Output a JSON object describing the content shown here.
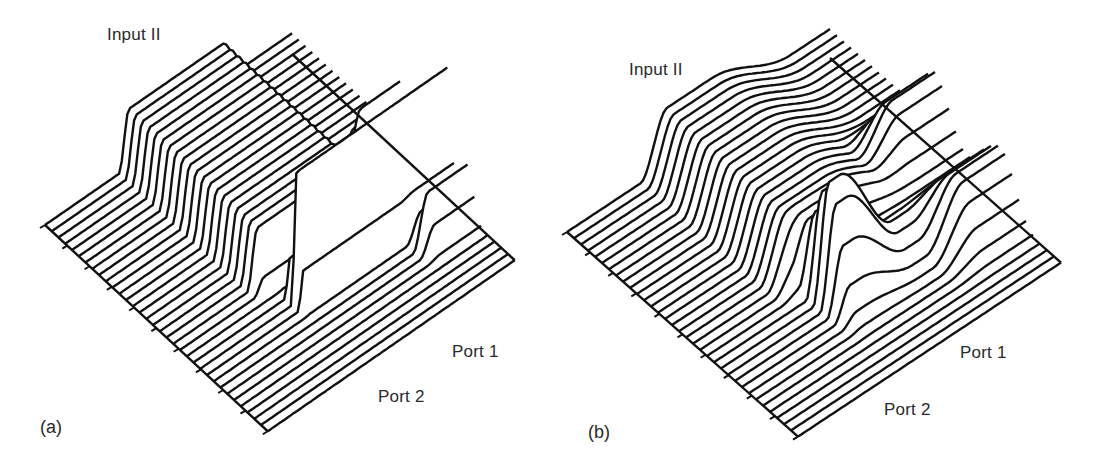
{
  "figure": {
    "panels": [
      {
        "id": "a",
        "panel_label": "(a)",
        "labels": {
          "input": "Input II",
          "port1": "Port 1",
          "port2": "Port 2"
        }
      },
      {
        "id": "b",
        "panel_label": "(b)",
        "labels": {
          "input": "Input II",
          "port1": "Port 1",
          "port2": "Port 2"
        }
      }
    ]
  },
  "chart_data": [
    {
      "type": "line",
      "subtype": "waterfall-3d",
      "title": "(a)",
      "xlabel": "",
      "ylabel": "",
      "annotations": [
        "Input II",
        "Port 1",
        "Port 2"
      ],
      "grid": false,
      "legend": null,
      "style": {
        "line_color": "#111111",
        "background": "#ffffff",
        "traces": 34,
        "tick_marks_on_left_edge": 11
      },
      "description": "Waterfall of field intensity along propagation: a narrow tall peak injected at Input II with a broad plateau (input I side) that separates into sharp peaks at Port 2 and Port 1 at the output.",
      "geometry": {
        "origin": [
          45,
          225
        ],
        "transverse_step": [
          6.75,
          6.25
        ],
        "propagation_vector": [
          247,
          -171
        ],
        "n_traces": 34
      },
      "profile": {
        "plateau_height_front": 58,
        "input_peak_trace": 23,
        "input_peak_height": 130,
        "output_port2_trace": 16,
        "output_port1_trace": 26,
        "output_peak_height": 52
      }
    },
    {
      "type": "line",
      "subtype": "waterfall-3d",
      "title": "(b)",
      "xlabel": "",
      "ylabel": "",
      "annotations": [
        "Input II",
        "Port 1",
        "Port 2"
      ],
      "grid": false,
      "legend": null,
      "style": {
        "line_color": "#111111",
        "background": "#ffffff",
        "traces": 34,
        "tick_marks_on_left_edge": 11
      },
      "description": "Waterfall of field intensity: smoother Gaussian-like peaks; input at Input II coupling to rounded outputs at Port 2 and Port 1.",
      "geometry": {
        "origin": [
          567,
          232
        ],
        "transverse_step": [
          7.0,
          6.2
        ],
        "propagation_vector": [
          263,
          -174
        ],
        "n_traces": 34
      },
      "profile": {
        "plateau_height_front": 58,
        "input_peak_trace": 22,
        "input_peak_height": 115,
        "output_port2_trace": 15,
        "output_port1_trace": 25,
        "output_peak_height": 50
      }
    }
  ]
}
